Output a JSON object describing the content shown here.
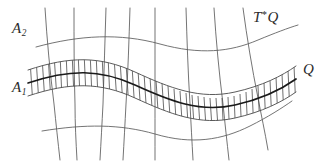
{
  "figure": {
    "kind": "mathematical-diagram",
    "background_color": "#ffffff",
    "line_color": "#555555",
    "bold_line_color": "#1a1a1a",
    "hatch_color": "#4a4a4a",
    "width": 326,
    "height": 167
  },
  "labels": {
    "upper_left": {
      "base": "A",
      "subscript": "2",
      "text": "A2"
    },
    "lower_left": {
      "base": "A",
      "subscript": "1",
      "text": "A1"
    },
    "upper_right": {
      "base": "T",
      "superscript": "*",
      "tail": "Q",
      "text": "T*Q"
    },
    "right": {
      "base": "Q",
      "text": "Q"
    }
  },
  "geometry": {
    "horizontal_curves": [
      {
        "name": "top-curve",
        "id": "curve-top"
      },
      {
        "name": "band-upper-edge",
        "id": "curve-band-upper"
      },
      {
        "name": "band-center-bold",
        "id": "curve-band-center"
      },
      {
        "name": "band-lower-edge",
        "id": "curve-band-lower"
      },
      {
        "name": "bottom-curve",
        "id": "curve-bottom"
      }
    ],
    "vertical_curve_count": 8,
    "hatch_mark_count": 44,
    "band_start_x": 28,
    "band_end_x": 296
  }
}
